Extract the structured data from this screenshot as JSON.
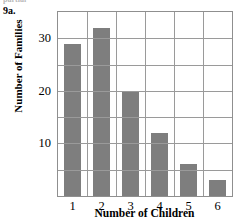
{
  "annotation": {
    "problem_label": "9a.",
    "cut_text_above": "partial"
  },
  "chart_data": {
    "type": "bar",
    "title": "",
    "xlabel": "Number of Children",
    "ylabel": "Number of Families",
    "categories": [
      "1",
      "2",
      "3",
      "4",
      "5",
      "6"
    ],
    "values": [
      29,
      32,
      20,
      12,
      6,
      3
    ],
    "ylim": [
      0,
      35
    ],
    "ytick_labels": [
      "10",
      "20",
      "30"
    ],
    "ytick_values": [
      10,
      20,
      30
    ],
    "gridline_values": [
      0,
      5,
      10,
      15,
      20,
      25,
      30,
      35
    ],
    "grid": "both",
    "legend": "none",
    "bar_color": "#7e7e7e",
    "grid_color": "#9a9a9a",
    "axis_color": "#8f8f8f"
  }
}
